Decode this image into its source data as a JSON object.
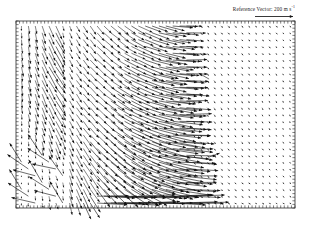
{
  "figure": {
    "name": "vector-field-quiver-plot",
    "background_color": "#ffffff",
    "ink_color": "#101010",
    "width": 311,
    "height": 232
  },
  "reference_vector": {
    "label_prefix": "Reference Vector:",
    "magnitude": "200",
    "units": "m s",
    "units_exponent": "-1",
    "full_label": "Reference Vector: 200 m s",
    "arrow_length_px": 38,
    "arrow_color": "#151515"
  },
  "frame": {
    "left": 16,
    "top": 21,
    "right": 295,
    "bottom": 208,
    "border_color": "#2a2a2a",
    "border_width": 0.8,
    "tick_color": "#2a2a2a",
    "tick_length": 2.6,
    "tick_count_x": 78,
    "tick_count_y": 52
  },
  "chart_data": {
    "type": "quiver",
    "title": "",
    "subtitle": "",
    "xlabel": "",
    "ylabel": "",
    "grid": false,
    "legend_position": "top-right",
    "xlim": [
      0,
      1
    ],
    "ylim": [
      0,
      1
    ],
    "tick_labels_x": [],
    "tick_labels_y": [],
    "annotations": [],
    "reference_magnitude": 200,
    "reference_units": "m s^-1",
    "grid_spacing_px": 6.6,
    "grid_cols": 40,
    "grid_rows": 27,
    "field_model": {
      "calm_zone_x_start": 0.63,
      "calm_zone_magnitude": 0.09,
      "max_magnitude": 1.0,
      "left_vertical_band_end": 0.14,
      "jet_core_y": 0.82,
      "shear_center_x": 0.3
    },
    "regions": [
      {
        "name": "left-vertical-band",
        "x_range": [
          0.0,
          0.14
        ],
        "y_range": [
          0.0,
          1.0
        ],
        "mean_direction_deg": 268,
        "mean_magnitude": 0.33,
        "note": "short near-vertical arrows pointing downward/upward along left edge"
      },
      {
        "name": "shear-transition",
        "x_range": [
          0.14,
          0.38
        ],
        "y_range": [
          0.0,
          1.0
        ],
        "mean_direction_deg": 40,
        "mean_magnitude": 0.55,
        "note": "arrows rotate from vertical toward up-right diagonal"
      },
      {
        "name": "central-jet",
        "x_range": [
          0.38,
          0.63
        ],
        "y_range": [
          0.0,
          1.0
        ],
        "mean_direction_deg": 12,
        "mean_magnitude": 0.95,
        "note": "long nearly horizontal arrows pointing right, strongest of the field"
      },
      {
        "name": "quiet-right-field",
        "x_range": [
          0.63,
          1.0
        ],
        "y_range": [
          0.0,
          1.0
        ],
        "mean_direction_deg": 35,
        "mean_magnitude": 0.08,
        "note": "very short stub vectors forming a regular dotted lattice"
      },
      {
        "name": "lower-left-outflow",
        "x_range": [
          0.0,
          0.18
        ],
        "y_range": [
          0.7,
          1.0
        ],
        "mean_direction_deg": 215,
        "mean_magnitude": 0.85,
        "note": "several long arrows directed down and to the left"
      },
      {
        "name": "bottom-jet-streak",
        "x_range": [
          0.28,
          0.66
        ],
        "y_range": [
          0.93,
          1.0
        ],
        "mean_direction_deg": 2,
        "mean_magnitude": 1.0,
        "note": "single long horizontal streak near the bottom of the frame"
      }
    ],
    "isolated_vectors": [
      {
        "x": 0.7,
        "y": 0.3,
        "direction_deg": 150,
        "magnitude": 0.35,
        "note": "stray arrow in upper-right quiet zone"
      },
      {
        "x": 0.7,
        "y": 0.74,
        "direction_deg": 20,
        "magnitude": 0.33,
        "note": "stray arrow in lower-right quiet zone"
      }
    ]
  }
}
